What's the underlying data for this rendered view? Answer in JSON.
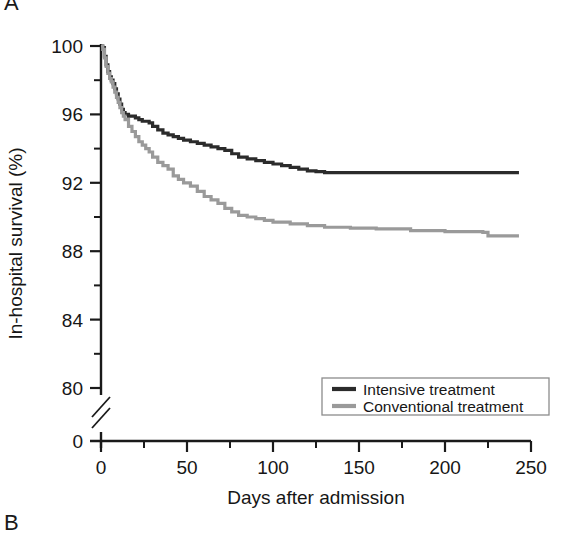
{
  "figure": {
    "panel_a_letter": "A",
    "panel_b_letter": "B"
  },
  "chart_data": {
    "type": "line",
    "title": "",
    "xlabel": "Days after admission",
    "ylabel": "In-hospital survival (%)",
    "xlim": [
      0,
      250
    ],
    "ylim": [
      80,
      100
    ],
    "y_axis_break": true,
    "y_axis_break_label": "0",
    "grid": false,
    "legend_position": "bottom-right",
    "xticks": [
      0,
      50,
      100,
      150,
      200,
      250
    ],
    "xtick_labels": [
      "0",
      "50",
      "100",
      "150",
      "200",
      "250"
    ],
    "xminor_ticks": [
      25,
      75,
      125,
      175,
      225
    ],
    "yticks": [
      80,
      84,
      88,
      92,
      96,
      100
    ],
    "ytick_labels": [
      "80",
      "84",
      "88",
      "92",
      "96",
      "100"
    ],
    "yminor_ticks": [
      82,
      86,
      90,
      94,
      98
    ],
    "colors": {
      "intensive": "#2b2b2b",
      "conventional": "#9a9a9a",
      "axis": "#1a1a1a"
    },
    "series": [
      {
        "name": "Intensive treatment",
        "color": "#2b2b2b",
        "legend_key": "intensive",
        "points": [
          [
            0,
            100.0
          ],
          [
            1,
            99.9
          ],
          [
            2,
            99.4
          ],
          [
            3,
            98.9
          ],
          [
            4,
            98.5
          ],
          [
            5,
            98.2
          ],
          [
            6,
            98.0
          ],
          [
            7,
            97.8
          ],
          [
            8,
            97.5
          ],
          [
            9,
            97.2
          ],
          [
            10,
            96.9
          ],
          [
            11,
            96.6
          ],
          [
            12,
            96.3
          ],
          [
            13,
            96.1
          ],
          [
            14,
            96.0
          ],
          [
            16,
            95.9
          ],
          [
            18,
            95.9
          ],
          [
            20,
            95.8
          ],
          [
            22,
            95.7
          ],
          [
            24,
            95.6
          ],
          [
            26,
            95.6
          ],
          [
            28,
            95.5
          ],
          [
            30,
            95.3
          ],
          [
            33,
            95.1
          ],
          [
            36,
            94.9
          ],
          [
            39,
            94.8
          ],
          [
            42,
            94.7
          ],
          [
            45,
            94.6
          ],
          [
            48,
            94.5
          ],
          [
            52,
            94.4
          ],
          [
            56,
            94.3
          ],
          [
            60,
            94.2
          ],
          [
            64,
            94.1
          ],
          [
            68,
            94.0
          ],
          [
            72,
            93.9
          ],
          [
            76,
            93.7
          ],
          [
            80,
            93.5
          ],
          [
            85,
            93.4
          ],
          [
            90,
            93.3
          ],
          [
            95,
            93.2
          ],
          [
            100,
            93.1
          ],
          [
            105,
            93.0
          ],
          [
            110,
            92.9
          ],
          [
            115,
            92.8
          ],
          [
            120,
            92.7
          ],
          [
            125,
            92.65
          ],
          [
            130,
            92.6
          ],
          [
            150,
            92.6
          ],
          [
            175,
            92.6
          ],
          [
            200,
            92.6
          ],
          [
            225,
            92.6
          ],
          [
            243,
            92.6
          ]
        ]
      },
      {
        "name": "Conventional treatment",
        "color": "#9a9a9a",
        "legend_key": "conventional",
        "points": [
          [
            0,
            100.0
          ],
          [
            1,
            99.8
          ],
          [
            2,
            99.3
          ],
          [
            3,
            98.8
          ],
          [
            4,
            98.4
          ],
          [
            5,
            98.1
          ],
          [
            6,
            97.9
          ],
          [
            7,
            97.6
          ],
          [
            8,
            97.3
          ],
          [
            9,
            97.0
          ],
          [
            10,
            96.7
          ],
          [
            11,
            96.4
          ],
          [
            12,
            96.1
          ],
          [
            13,
            95.9
          ],
          [
            14,
            95.7
          ],
          [
            16,
            95.3
          ],
          [
            18,
            95.0
          ],
          [
            20,
            94.7
          ],
          [
            22,
            94.4
          ],
          [
            24,
            94.2
          ],
          [
            26,
            94.0
          ],
          [
            28,
            93.8
          ],
          [
            30,
            93.5
          ],
          [
            33,
            93.2
          ],
          [
            36,
            93.0
          ],
          [
            39,
            92.8
          ],
          [
            42,
            92.4
          ],
          [
            45,
            92.2
          ],
          [
            48,
            92.0
          ],
          [
            52,
            91.8
          ],
          [
            56,
            91.5
          ],
          [
            60,
            91.2
          ],
          [
            64,
            91.0
          ],
          [
            68,
            90.8
          ],
          [
            72,
            90.5
          ],
          [
            76,
            90.3
          ],
          [
            80,
            90.1
          ],
          [
            85,
            90.0
          ],
          [
            90,
            89.9
          ],
          [
            95,
            89.8
          ],
          [
            100,
            89.7
          ],
          [
            110,
            89.6
          ],
          [
            120,
            89.5
          ],
          [
            130,
            89.4
          ],
          [
            145,
            89.35
          ],
          [
            160,
            89.3
          ],
          [
            180,
            89.2
          ],
          [
            200,
            89.15
          ],
          [
            222,
            89.1
          ],
          [
            225,
            88.9
          ],
          [
            243,
            88.9
          ]
        ]
      }
    ],
    "legend": [
      {
        "label": "Intensive treatment",
        "color": "#2b2b2b"
      },
      {
        "label": "Conventional treatment",
        "color": "#9a9a9a"
      }
    ]
  }
}
